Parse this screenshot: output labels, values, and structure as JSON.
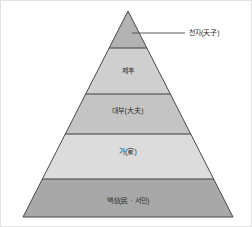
{
  "diagram": {
    "type": "pyramid",
    "title": "",
    "apex": {
      "x": 127,
      "y": 10
    },
    "base": {
      "left_x": 22,
      "right_x": 232,
      "y": 216
    },
    "outline_color": "#4a4a4a",
    "divider_color": "#3c3c3c",
    "text_color": "#2b2b2b",
    "background_color": "#ffffff",
    "frame_color": "#e2e2e2",
    "tiers": [
      {
        "rank": 1,
        "label": "천자(天子)",
        "label_placement": "external-right",
        "fill": "#b3b3b3",
        "top_y": 10,
        "bottom_y": 47
      },
      {
        "rank": 2,
        "label": "제후",
        "label_placement": "inside",
        "fill": "#cfcfcf",
        "top_y": 47,
        "bottom_y": 93,
        "label_x": 127,
        "label_y": 70
      },
      {
        "rank": 3,
        "label": "대부(大夫)",
        "label_placement": "inside",
        "fill": "#c4c4c4",
        "top_y": 93,
        "bottom_y": 133,
        "label_x": 127,
        "label_y": 110
      },
      {
        "rank": 4,
        "label": "가(家)",
        "label_placement": "inside",
        "fill": "#dcdcdc",
        "top_y": 133,
        "bottom_y": 178,
        "label_x": 127,
        "label_y": 151
      },
      {
        "rank": 5,
        "label": "백성(民 · 서민)",
        "label_placement": "inside",
        "fill": "#a8a8a8",
        "top_y": 178,
        "bottom_y": 216,
        "label_x": 127,
        "label_y": 200
      }
    ],
    "callout": {
      "label": "천자(天子)",
      "line_start_x": 131,
      "line_start_y": 32,
      "line_end_x": 184,
      "line_end_y": 32,
      "line_color": "#4a4a4a",
      "label_x": 188,
      "label_y": 32
    }
  }
}
